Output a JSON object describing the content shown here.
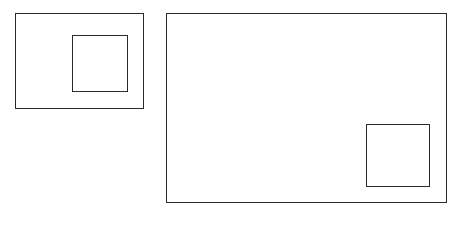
{
  "diagram": {
    "stroke_color": "#2a2a2a",
    "background": "#ffffff",
    "panels": [
      {
        "name": "small-panel",
        "outer": {
          "x": 15,
          "y": 13,
          "w": 129,
          "h": 96
        },
        "inner": {
          "x": 72,
          "y": 35,
          "w": 56,
          "h": 57
        }
      },
      {
        "name": "large-panel",
        "outer": {
          "x": 166,
          "y": 13,
          "w": 281,
          "h": 190
        },
        "inner": {
          "x": 366,
          "y": 124,
          "w": 64,
          "h": 63
        }
      }
    ]
  }
}
